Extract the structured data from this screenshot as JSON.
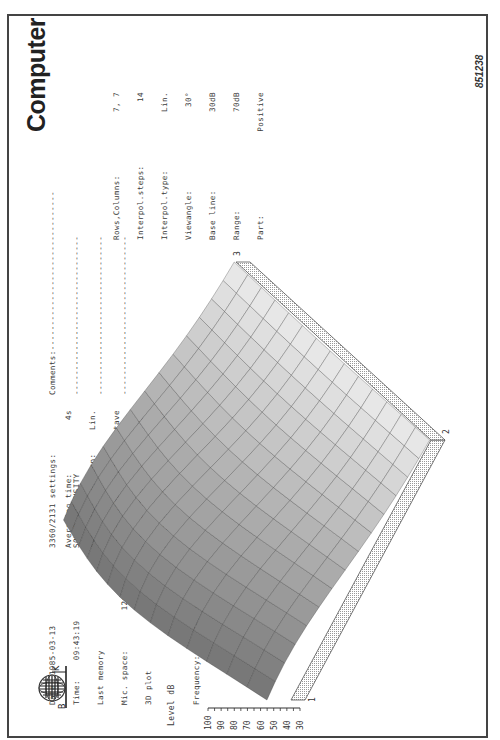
{
  "figure_number": "851238",
  "logo": {
    "left_letter": "B",
    "right_letter": "K"
  },
  "header_left": {
    "date_label": "Date:",
    "date_value": "1985-03-13",
    "time_label": "Time:",
    "time_value": "09:43:19",
    "last_memory": "Last memory",
    "mic_space_label": "Mic. space:",
    "mic_space_value": "12mm",
    "plot_type": "3D plot",
    "frequency_label": "Frequency:",
    "frequency_value": "400.0Hz"
  },
  "settings": {
    "title": "3360/2131 settings:",
    "mode": "SOUND INTENSITY",
    "rows": [
      {
        "label": "Averaging time:",
        "value": "4s"
      },
      {
        "label": "Averaging function:",
        "value": "Lin."
      },
      {
        "label": "Filter bandw. 1/3",
        "value": "octave"
      },
      {
        "label": "Input attenuator:",
        "value": "30.0dB"
      },
      {
        "label": "Reference adjust.:",
        "value": "0dB"
      }
    ]
  },
  "comments": {
    "label": "Comments:",
    "lines": [
      "--------------------------------",
      "--------------------------------",
      "--------------------------------",
      "--------------------------------"
    ],
    "title": "Computer"
  },
  "plot_settings": [
    {
      "label": "Rows,Columns:",
      "value": "7, 7"
    },
    {
      "label": "Interpol.steps:",
      "value": "14"
    },
    {
      "label": "Interpol.type:",
      "value": "Lin."
    },
    {
      "label": "Viewangle:",
      "value": "30°"
    },
    {
      "label": "Base line:",
      "value": "30dB"
    },
    {
      "label": "Range:",
      "value": "70dB"
    },
    {
      "label": "Part:",
      "value": "Positive"
    }
  ],
  "chart_data": {
    "type": "surface3d",
    "zlabel": "Level dB",
    "zticks": [
      "100",
      "90",
      "80",
      "70",
      "60",
      "50",
      "40",
      "30"
    ],
    "zlim": [
      30,
      100
    ],
    "corner_labels": [
      "1",
      "2",
      "3"
    ],
    "grid_rows": 7,
    "grid_columns": 7,
    "peak_level_db_approx": 72,
    "edge_level_db_approx": 42
  }
}
